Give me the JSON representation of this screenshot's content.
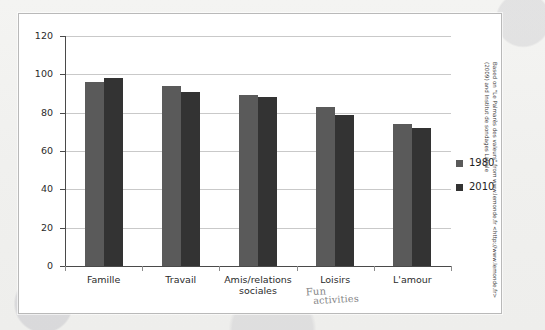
{
  "chart_data": {
    "type": "bar",
    "title": "",
    "xlabel": "",
    "ylabel": "",
    "ylim": [
      0,
      120
    ],
    "ytick_step": 20,
    "yticks": [
      "0",
      "20",
      "40",
      "60",
      "80",
      "100",
      "120"
    ],
    "grid": true,
    "legend_position": "right",
    "categories": [
      "Famille",
      "Travail",
      "Amis/relations sociales",
      "Loisirs",
      "L'amour"
    ],
    "category_lines": [
      [
        "Famille"
      ],
      [
        "Travail"
      ],
      [
        "Amis/relations",
        "sociales"
      ],
      [
        "Loisirs"
      ],
      [
        "L'amour"
      ]
    ],
    "series": [
      {
        "name": "1980",
        "color": "#5a5a5a",
        "values": [
          96,
          94,
          89,
          83,
          74
        ]
      },
      {
        "name": "2010",
        "color": "#333333",
        "values": [
          98,
          91,
          88,
          79,
          72
        ]
      }
    ]
  },
  "legend": {
    "items": [
      {
        "label": "1980",
        "color": "#5a5a5a"
      },
      {
        "label": "2010",
        "color": "#333333"
      }
    ]
  },
  "annotations": {
    "handwritten": {
      "line1": "Fun",
      "line2": "activities"
    }
  },
  "credit": {
    "line1": "Based on \"Le Palmarès des valeurs\" from www.lemonde.fr <http://www.lemonde.fr>",
    "line2": "(2009) and Institut de sondages Labale"
  }
}
